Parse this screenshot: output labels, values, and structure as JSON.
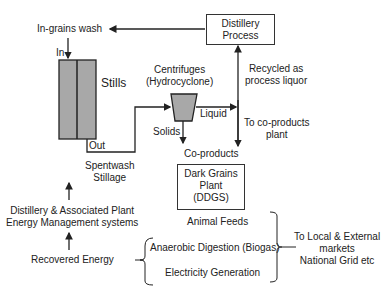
{
  "diagram": {
    "nodes": {
      "distillery_process": "Distillery\nProcess",
      "in_grains_wash": "In-grains wash",
      "in_label": "In",
      "stills": "Stills",
      "out_label": "Out",
      "centrifuges": "Centrifuges\n(Hydrocyclone)",
      "solids": "Solids",
      "liquid": "Liquid",
      "recycled": "Recycled as\nprocess liquor",
      "to_coproducts": "To co-products\nplant",
      "coproducts": "Co-products",
      "dark_grains": "Dark Grains\nPlant\n(DDGS)",
      "spentwash": "Spentwash\nStillage",
      "energy_mgmt": "Distillery & Associated Plant\nEnergy Management systems",
      "recovered_energy": "Recovered Energy",
      "animal_feeds": "Animal Feeds",
      "anaerobic": "Anaerobic Digestion (Biogas)",
      "electricity": "Electricity Generation",
      "markets": "To Local & External\nmarkets\nNational Grid etc"
    },
    "colors": {
      "stills_fill": "#a8a8a8",
      "centrifuge_fill": "#a8a8a8",
      "line": "#222222"
    }
  }
}
